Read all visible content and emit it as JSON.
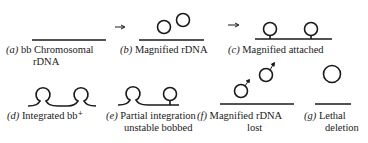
{
  "diagram": {
    "stroke_color": "#1a1a1a",
    "panels": [
      {
        "id": "a",
        "tag": "(a)",
        "line1": "bb Chromosomal",
        "line2": "rDNA"
      },
      {
        "id": "b",
        "tag": "(b)",
        "line1": "Magnified rDNA",
        "line2": ""
      },
      {
        "id": "c",
        "tag": "(c)",
        "line1": "Magnified attached",
        "line2": ""
      },
      {
        "id": "d",
        "tag": "(d)",
        "line1": "Integrated bb⁺",
        "line2": ""
      },
      {
        "id": "e",
        "tag": "(e)",
        "line1": "Partial integration",
        "line2": "unstable bobbed"
      },
      {
        "id": "f",
        "tag": "(f)",
        "line1": "Magnified rDNA",
        "line2": "lost"
      },
      {
        "id": "g",
        "tag": "(g)",
        "line1": "Lethal",
        "line2": "deletion"
      }
    ],
    "arrows": [
      "a-to-b",
      "b-to-c"
    ]
  }
}
